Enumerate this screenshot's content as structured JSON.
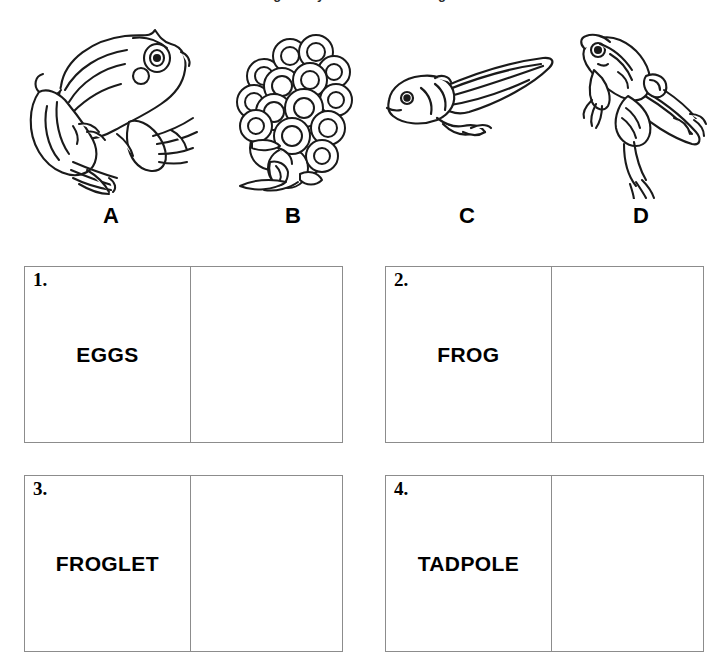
{
  "page": {
    "title_remnant": "frog life cycle worksheet diagram",
    "background_color": "#ffffff",
    "ink_color": "#000000",
    "box_border_color": "#8c8c8c"
  },
  "specimens": [
    {
      "letter": "A",
      "icon": "adult-frog-illustration",
      "description": "Adult frog in side profile facing right"
    },
    {
      "letter": "B",
      "icon": "frog-eggs-illustration",
      "description": "Cluster of frog eggs with hatching tadpoles"
    },
    {
      "letter": "C",
      "icon": "tadpole-illustration",
      "description": "Tadpole with long tail and small hind legs"
    },
    {
      "letter": "D",
      "icon": "froglet-illustration",
      "description": "Froglet with four legs and a shrinking tail"
    }
  ],
  "answer_boxes": [
    {
      "number": "1.",
      "term": "EGGS",
      "answer": ""
    },
    {
      "number": "2.",
      "term": "FROG",
      "answer": ""
    },
    {
      "number": "3.",
      "term": "FROGLET",
      "answer": ""
    },
    {
      "number": "4.",
      "term": "TADPOLE",
      "answer": ""
    }
  ]
}
